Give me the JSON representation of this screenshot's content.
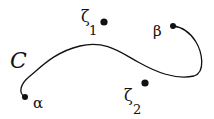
{
  "diagram": {
    "curve_label": "C",
    "points": {
      "alpha": {
        "label": "α",
        "x": 25,
        "y": 97
      },
      "beta": {
        "label": "β",
        "x": 173,
        "y": 26
      },
      "zeta1": {
        "label": "ζ",
        "subscript": "1",
        "x": 104,
        "y": 22
      },
      "zeta2": {
        "label": "ζ",
        "subscript": "2",
        "x": 145,
        "y": 83
      }
    },
    "colors": {
      "ink": "#111111",
      "background": "#ffffff"
    }
  }
}
